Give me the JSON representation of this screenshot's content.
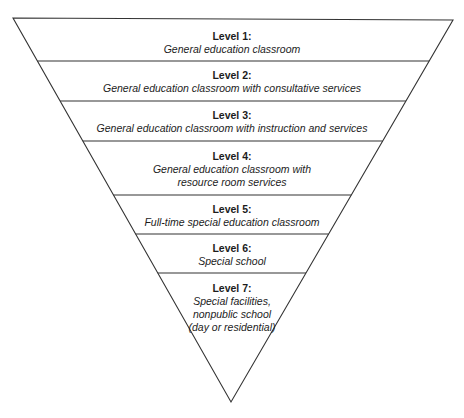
{
  "diagram": {
    "stroke_color": "#333333",
    "levels": [
      {
        "level": "Level 1:",
        "description": "General education classroom"
      },
      {
        "level": "Level 2:",
        "description": "General education classroom with consultative services"
      },
      {
        "level": "Level 3:",
        "description": "General education classroom with instruction and services"
      },
      {
        "level": "Level 4:",
        "description": "General education classroom with resource room services"
      },
      {
        "level": "Level 5:",
        "description": "Full-time special education classroom"
      },
      {
        "level": "Level 6:",
        "description": "Special school"
      },
      {
        "level": "Level 7:",
        "description": "Special facilities, nonpublic school (day or residential)"
      }
    ]
  }
}
